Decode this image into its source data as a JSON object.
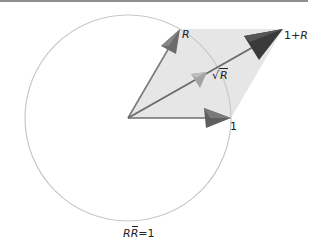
{
  "diagram": {
    "type": "complex-plane-vector-diagram",
    "labels": {
      "r": "R",
      "one_plus_r_prefix": "1+",
      "one_plus_r_var": "R",
      "sqrt_symbol": "√",
      "sqrt_var": "R",
      "one": "1",
      "circle_r": "R",
      "circle_rbar": "R",
      "circle_eq": "=1"
    },
    "colors": {
      "circle": "#c8c8c8",
      "parallelogram_fill": "#e6e6e6",
      "arrow_r": "#6b6b6b",
      "arrow_one": "#5e5e5e",
      "arrow_sqrt_r": "#a3a3a3",
      "arrow_one_plus_r": "#3a3a3a",
      "top_rule": "#8f8f8f"
    },
    "geometry": {
      "origin": [
        128,
        118
      ],
      "circle_radius": 103,
      "point_one": [
        231,
        118
      ],
      "point_r": [
        180,
        29
      ],
      "point_one_plus_r": [
        283,
        29
      ],
      "point_sqrt_r": [
        207,
        75
      ]
    }
  }
}
